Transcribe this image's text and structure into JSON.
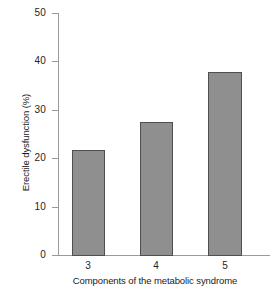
{
  "chart_data": {
    "type": "bar",
    "title": "",
    "subtitle": "",
    "xlabel": "Components of the metabolic syndrome",
    "ylabel": "Erectile dysfunction (%)",
    "categories": [
      "3",
      "4",
      "5"
    ],
    "values": [
      21.7,
      27.5,
      37.8
    ],
    "series": [
      {
        "name": "Erectile dysfunction",
        "values": [
          21.7,
          27.5,
          37.8
        ]
      }
    ],
    "ylim": [
      0,
      50
    ],
    "y_ticks": [
      0,
      10,
      20,
      30,
      40,
      50
    ],
    "y_tick_labels": [
      "0",
      "10",
      "20",
      "30",
      "40",
      "50"
    ],
    "x_tick_labels": [
      "3",
      "4",
      "5"
    ],
    "grid": false,
    "legend": "none",
    "annotations": [],
    "colors": {
      "bar_fill": "#8f8f8f",
      "bar_edge": "#4f4f4f",
      "axis": "#9a9a9a",
      "text": "#1a1a1a",
      "background": "#ffffff"
    }
  }
}
